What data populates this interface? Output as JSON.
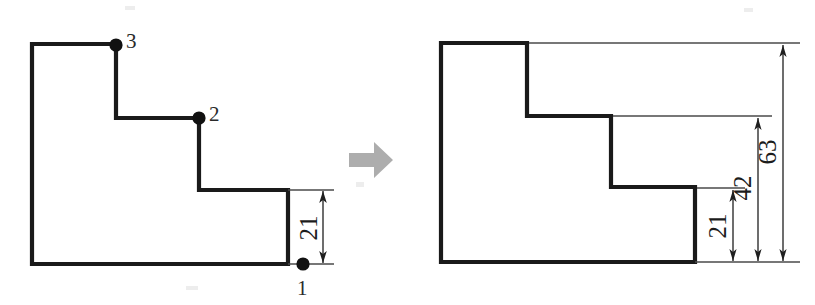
{
  "diagram": {
    "background_color": "#ffffff",
    "outline_color": "#1a1a1a",
    "dimension_color": "#1f1f1f",
    "transform_arrow_color": "#adadad",
    "left_panel": {
      "name": "numbered-vertices-figure",
      "shape_name": "stepped-profile",
      "vertex_markers": [
        {
          "label": "1",
          "marker": "filled-dot",
          "dot_x": 303,
          "dot_y": 264,
          "label_x": 297,
          "label_y": 295
        },
        {
          "label": "2",
          "marker": "filled-dot",
          "dot_x": 199,
          "dot_y": 118,
          "label_x": 209,
          "label_y": 121
        },
        {
          "label": "3",
          "marker": "filled-dot",
          "dot_x": 116,
          "dot_y": 45,
          "label_x": 126,
          "label_y": 48
        }
      ],
      "dimensions": [
        {
          "value": "21",
          "orientation": "vertical",
          "text_rotation_deg": -90
        }
      ]
    },
    "right_panel": {
      "name": "dimensioned-figure",
      "shape_name": "stepped-profile",
      "dimensions": [
        {
          "value": "21",
          "orientation": "vertical",
          "text_rotation_deg": -90,
          "from_label": "bottom-edge",
          "to_label": "first-step-top"
        },
        {
          "value": "42",
          "orientation": "vertical",
          "text_rotation_deg": -90,
          "from_label": "bottom-edge",
          "to_label": "second-step-top"
        },
        {
          "value": "63",
          "orientation": "vertical",
          "text_rotation_deg": -90,
          "from_label": "bottom-edge",
          "to_label": "profile-top"
        }
      ]
    },
    "transform_arrow": {
      "name": "rightward-transform-arrow",
      "direction": "right"
    }
  },
  "geometry": {
    "left_profile_path": "M 32,44 L 116,44 L 116,118 L 199,118 L 199,190 L 288,190 L 288,264 L 32,264 Z",
    "right_profile_path": "M 441,43 L 527,43 L 527,116 L 611,116 L 611,187 L 695,187 L 695,262 L 441,262 Z",
    "transform_arrow_path": "M 349,153 L 374,153 L 374,142 L 393,160 L 374,178 L 374,167 L 349,167 Z"
  }
}
